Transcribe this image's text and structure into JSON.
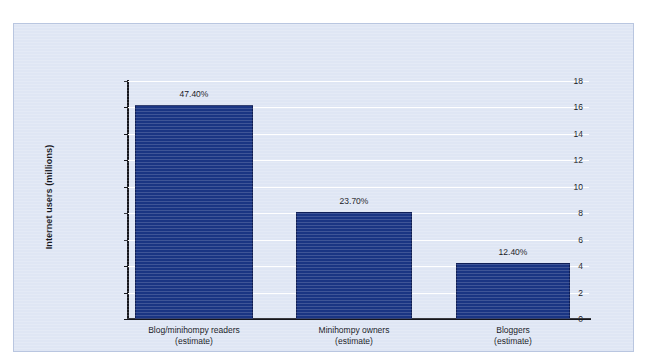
{
  "chart_data": {
    "type": "bar",
    "title": "",
    "xlabel": "",
    "ylabel": "Internet users (millions)",
    "categories": [
      "Blog/minihompy readers\n(estimate)",
      "Minihompy owners\n(estimate)",
      "Bloggers\n(estimate)"
    ],
    "category_lines": [
      [
        "Blog/minihompy readers",
        "(estimate)"
      ],
      [
        "Minihompy owners",
        "(estimate)"
      ],
      [
        "Bloggers",
        "(estimate)"
      ]
    ],
    "values": [
      16.2,
      8.1,
      4.25
    ],
    "data_labels": [
      "47.40%",
      "23.70%",
      "12.40%"
    ],
    "ylim": [
      0,
      18
    ],
    "yticks": [
      0,
      2,
      4,
      6,
      8,
      10,
      12,
      14,
      16,
      18
    ],
    "ytick_labels": [
      "0",
      "2",
      "4",
      "6",
      "8",
      "10",
      "12",
      "14",
      "16",
      "18"
    ],
    "grid": true,
    "legend": "none",
    "bar_color": "#1a3583",
    "plot_background": "#dfe6f4",
    "gridline_color": "#ffffff",
    "axis_color": "#15161c",
    "panel_border_color": "#b9c6e0"
  }
}
